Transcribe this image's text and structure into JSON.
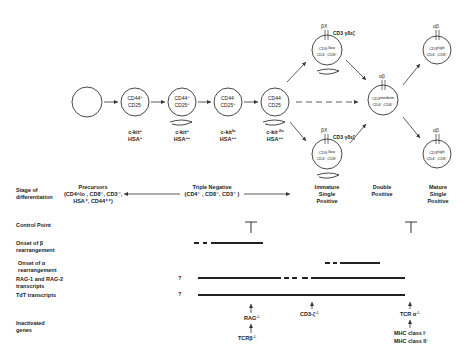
{
  "cells": [
    {
      "id": "stem",
      "lines": []
    },
    {
      "id": "dn1",
      "lines": [
        {
          "text": "CD44",
          "sup": "+"
        },
        {
          "text": "CD25",
          "sup": "-"
        }
      ],
      "below": [
        {
          "text": "c-kit",
          "sup": "+"
        },
        {
          "text": "HSA",
          "sup": "+"
        }
      ]
    },
    {
      "id": "dn2",
      "lines": [
        {
          "text": "CD44",
          "sup": "+"
        },
        {
          "text": "CD25",
          "sup": "+"
        }
      ],
      "below": [
        {
          "text": "c-kit",
          "sup": "+"
        },
        {
          "text": "HSA",
          "sup": "++"
        }
      ]
    },
    {
      "id": "dn3",
      "lines": [
        {
          "text": "CD44",
          "sup": "-"
        },
        {
          "text": "CD25",
          "sup": "+"
        }
      ],
      "below": [
        {
          "text": "c-kit",
          "sup": "lo"
        },
        {
          "text": "HSA",
          "sup": "++"
        }
      ]
    },
    {
      "id": "dn4",
      "lines": [
        {
          "text": "CD44",
          "sup": "-"
        },
        {
          "text": "CD25",
          "sup": "-"
        }
      ],
      "below": [
        {
          "text": "c-kit",
          "sup": "-/lo"
        },
        {
          "text": "HSA",
          "sup": "++"
        }
      ]
    },
    {
      "id": "isp_top",
      "receptor": "βX",
      "complex": "CD3 γδεζ",
      "lines": [
        {
          "text": "CD3",
          "sup": "-/low"
        },
        {
          "text": "CD4⁻,CD8⁺"
        }
      ]
    },
    {
      "id": "isp_bottom",
      "receptor": "βX",
      "complex": "CD3 γδεζ",
      "lines": [
        {
          "text": "CD3",
          "sup": "-/low"
        },
        {
          "text": "CD4⁺,CD8⁻"
        }
      ]
    },
    {
      "id": "dp",
      "receptor": "αβ",
      "lines": [
        {
          "text": "CD3",
          "sup": "medium"
        },
        {
          "text": "CD4⁺,CD8⁺"
        }
      ]
    },
    {
      "id": "sp_top",
      "receptor": "αβ",
      "lines": [
        {
          "text": "CD3",
          "sup": "high"
        },
        {
          "text": "CD4⁻,CD8⁺"
        }
      ]
    },
    {
      "id": "sp_bottom",
      "receptor": "αβ",
      "lines": [
        {
          "text": "CD3",
          "sup": "high"
        },
        {
          "text": "CD4⁺,CD8⁻"
        }
      ]
    }
  ],
  "stage_labels": {
    "isp": [
      "Immature",
      "Single",
      "Positive"
    ],
    "dp": [
      "Double",
      "Positive"
    ],
    "sp": [
      "Mature",
      "Single",
      "Positive"
    ]
  },
  "rows": {
    "stage": {
      "label": [
        "Stage of",
        "differentiation"
      ],
      "precursors": [
        "Precursors",
        "(CD4^lo , CD8⁻, CD3⁻,",
        "HSA⁺, CD44⁺⁺)"
      ],
      "triple_negative": [
        "Triple Negative",
        "(CD4⁻ , CD8⁻, CD3⁻ )"
      ]
    },
    "control_point": {
      "label": "Control Point",
      "symbol": "⊤"
    },
    "beta": {
      "label": [
        "Onset of β",
        "rearrangement"
      ]
    },
    "alpha": {
      "label": [
        "Onset of α",
        "rearrangement"
      ]
    },
    "rag": {
      "label": [
        "RAG-1 and RAG-2",
        "transcripts"
      ],
      "unknown": "?"
    },
    "tdt": {
      "label": [
        "TdT transcripts"
      ],
      "unknown": "?"
    },
    "inactivated": {
      "label": [
        "Inactivated",
        "genes"
      ],
      "rag": "RAG",
      "tcrb": "TCRβ",
      "cd3z": "CD3-ζ",
      "tcra": "TCR α",
      "mhc1": "MHC class I",
      "mhc2": "MHC class II",
      "ko": "-/-",
      "neg": "-"
    }
  }
}
